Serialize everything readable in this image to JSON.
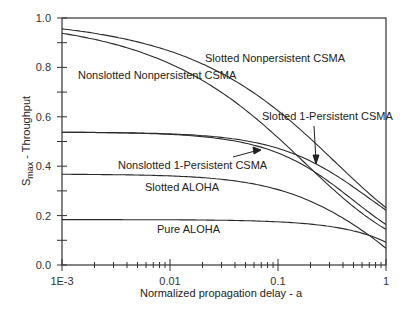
{
  "chart_data": {
    "type": "line",
    "title": "",
    "xlabel": "Normalized propagation delay - a",
    "ylabel": "S_max - Throughput",
    "ylabel_main": "S",
    "ylabel_sub": "max",
    "ylabel_rest": " - Throughput",
    "xscale": "log",
    "xlim": [
      0.001,
      1
    ],
    "ylim": [
      0.0,
      1.0
    ],
    "grid": false,
    "legend": "inline labels",
    "x_ticks": [
      "1E-3",
      "0.01",
      "0.1",
      "1"
    ],
    "y_ticks": [
      "0.0",
      "0.2",
      "0.4",
      "0.6",
      "0.8",
      "1.0"
    ],
    "x": [
      0.001,
      0.002,
      0.005,
      0.01,
      0.02,
      0.05,
      0.1,
      0.2,
      0.5,
      1
    ],
    "series": [
      {
        "name": "Slotted Nonpersistent CSMA",
        "values": [
          0.92,
          0.89,
          0.83,
          0.78,
          0.7,
          0.55,
          0.4,
          0.24,
          0.06,
          0.0
        ]
      },
      {
        "name": "Nonslotted Nonpersistent CSMA",
        "values": [
          0.9,
          0.87,
          0.81,
          0.75,
          0.66,
          0.48,
          0.31,
          0.17,
          0.03,
          0.0
        ]
      },
      {
        "name": "Slotted 1-Persistent CSMA",
        "values": [
          0.54,
          0.54,
          0.53,
          0.53,
          0.52,
          0.5,
          0.47,
          0.4,
          0.25,
          0.16
        ]
      },
      {
        "name": "Nonslotted 1-Persistent CSMA",
        "values": [
          0.54,
          0.54,
          0.53,
          0.53,
          0.52,
          0.49,
          0.45,
          0.37,
          0.25,
          0.18
        ]
      },
      {
        "name": "Slotted ALOHA",
        "values": [
          0.37,
          0.37,
          0.37,
          0.36,
          0.36,
          0.35,
          0.34,
          0.31,
          0.22,
          0.09
        ]
      },
      {
        "name": "Pure ALOHA",
        "values": [
          0.18,
          0.18,
          0.18,
          0.18,
          0.18,
          0.18,
          0.17,
          0.16,
          0.12,
          0.09
        ]
      }
    ],
    "annotations": [
      {
        "text": "Slotted Nonpersistent CSMA"
      },
      {
        "text": "Nonslotted Nonpersistent CSMA"
      },
      {
        "text": "Slotted 1-Persistent CSMA"
      },
      {
        "text": "Nonslotted 1-Persistent CSMA"
      },
      {
        "text": "Slotted ALOHA"
      },
      {
        "text": "Pure ALOHA"
      }
    ]
  }
}
